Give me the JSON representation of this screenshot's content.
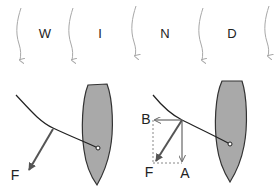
{
  "wind_letters": [
    "W",
    "I",
    "N",
    "D"
  ],
  "wind_arrow_count": 5,
  "left_diagram": {
    "force_label": "F"
  },
  "right_diagram": {
    "force_label": "F",
    "component_a_label": "A",
    "component_b_label": "B"
  },
  "colors": {
    "wind_arrow": "#a8a8a8",
    "hull_fill": "#a9a9a9",
    "hull_stroke": "#333333",
    "sail_line": "#222222",
    "force_arrow": "#555555",
    "component_arrow": "#666666",
    "dashed_line": "#888888",
    "text": "#222222"
  }
}
